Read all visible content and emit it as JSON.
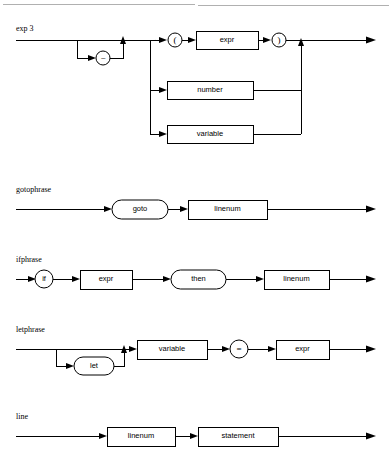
{
  "page": {
    "width": 389,
    "height": 455,
    "background": "#ffffff",
    "line_color": "#000000",
    "top_rule_color": "#b0b0b0"
  },
  "diagrams": [
    {
      "id": "exp3",
      "title": "exp 3",
      "nodes": [
        {
          "id": "minus",
          "label": "−",
          "shape": "circle"
        },
        {
          "id": "lparen",
          "label": "(",
          "shape": "circle"
        },
        {
          "id": "expr",
          "label": "expr",
          "shape": "box"
        },
        {
          "id": "rparen",
          "label": ")",
          "shape": "circle"
        },
        {
          "id": "number",
          "label": "number",
          "shape": "box"
        },
        {
          "id": "variable",
          "label": "variable",
          "shape": "box"
        }
      ]
    },
    {
      "id": "gotophrase",
      "title": "gotophrase",
      "nodes": [
        {
          "id": "goto",
          "label": "goto",
          "shape": "rounded"
        },
        {
          "id": "linenum",
          "label": "linenum",
          "shape": "box"
        }
      ]
    },
    {
      "id": "ifphrase",
      "title": "ifphrase",
      "nodes": [
        {
          "id": "if",
          "label": "if",
          "shape": "circle"
        },
        {
          "id": "expr",
          "label": "expr",
          "shape": "box"
        },
        {
          "id": "then",
          "label": "then",
          "shape": "rounded"
        },
        {
          "id": "linenum",
          "label": "linenum",
          "shape": "box"
        }
      ]
    },
    {
      "id": "letphrase",
      "title": "letphrase",
      "nodes": [
        {
          "id": "let",
          "label": "let",
          "shape": "rounded"
        },
        {
          "id": "variable",
          "label": "variable",
          "shape": "box"
        },
        {
          "id": "equals",
          "label": "=",
          "shape": "circle"
        },
        {
          "id": "expr",
          "label": "expr",
          "shape": "box"
        }
      ]
    },
    {
      "id": "line",
      "title": "line",
      "nodes": [
        {
          "id": "linenum",
          "label": "linenum",
          "shape": "box"
        },
        {
          "id": "statement",
          "label": "statement",
          "shape": "box"
        }
      ]
    }
  ]
}
